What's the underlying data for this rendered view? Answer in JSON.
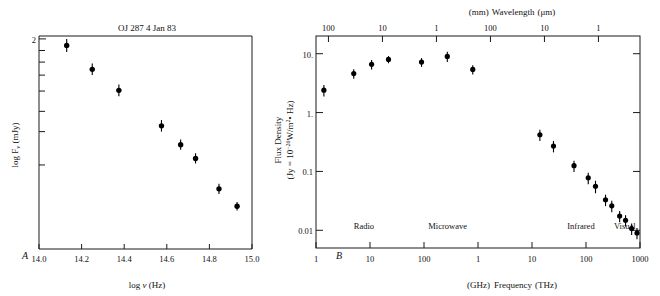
{
  "figure": {
    "background": "#ffffff",
    "ink": "#111111",
    "marker_color": "#000000"
  },
  "panel_a": {
    "label": "A",
    "title": "OJ 287    4 Jan 83",
    "xlabel_pre": "log ",
    "xlabel_sym": "ν",
    "xlabel_post": " (Hz)",
    "ylabel_pre": "log F",
    "ylabel_sub": "ν",
    "ylabel_post": " (mJy)",
    "x_ticks": [
      "14.0",
      "14.2",
      "14.4",
      "14.6",
      "14.8",
      "15.0"
    ],
    "y_ticks": [
      "2"
    ],
    "chart_data": {
      "type": "scatter",
      "title": "OJ 287    4 Jan 83",
      "xlabel": "log ν (Hz)",
      "ylabel": "log Fν (mJy)",
      "xlim": [
        14.0,
        15.0
      ],
      "ylim": [
        0.55,
        2.02
      ],
      "grid": false,
      "legend": "none",
      "xticks": [
        14.0,
        14.2,
        14.4,
        14.6,
        14.8,
        15.0
      ],
      "yticks_labeled": [
        2.0
      ],
      "yticks_minor": [
        1.92,
        1.84,
        1.75,
        1.64,
        1.5,
        1.36,
        1.13
      ],
      "x": [
        14.13,
        14.25,
        14.375,
        14.575,
        14.665,
        14.735,
        14.845,
        14.93
      ],
      "y": [
        1.955,
        1.79,
        1.645,
        1.4,
        1.27,
        1.175,
        0.965,
        0.845
      ],
      "yerr": [
        0.045,
        0.04,
        0.04,
        0.04,
        0.035,
        0.035,
        0.035,
        0.03
      ]
    }
  },
  "panel_b": {
    "label": "B",
    "top_axis_left_unit": "(mm)",
    "top_axis_name": "Wavelength",
    "top_axis_right_unit": "(μm)",
    "bottom_axis_left_unit": "(GHz)",
    "bottom_axis_name": "Frequency",
    "bottom_axis_right_unit": "(THz)",
    "ylabel_line1": "Flux Density",
    "ylabel_line2_a": "(Jy = 10",
    "ylabel_line2_exp": "−26",
    "ylabel_line2_b": "W/m",
    "ylabel_line2_exp2": "2",
    "ylabel_line2_c": "• Hz)",
    "y_ticks": [
      "10.",
      "1.",
      "0.1",
      "0.01"
    ],
    "top_ticks": [
      "100",
      "10",
      "1",
      "100",
      "10",
      "1"
    ],
    "bottom_ticks": [
      "1",
      "10",
      "100",
      "1",
      "10",
      "100",
      "1000"
    ],
    "bands": [
      "Radio",
      "Microwave",
      "Infrared",
      "Visual"
    ],
    "chart_data": {
      "type": "scatter",
      "title": "",
      "xlabel": "(GHz) Frequency (THz)",
      "ylabel": "Flux Density (Jy = 10−26 W/m2 • Hz)",
      "xlabel_top": "(mm) Wavelength (μm)",
      "x_is_log": true,
      "y_is_log": true,
      "xlim_ghz": [
        1,
        1000000
      ],
      "ylim": [
        0.005,
        20
      ],
      "grid": false,
      "legend": "none",
      "x_tick_values_ghz": [
        1,
        10,
        100,
        1000,
        10000,
        100000,
        1000000
      ],
      "x_tick_labels": [
        "1",
        "10",
        "100",
        "1",
        "10",
        "100",
        "1000"
      ],
      "y_tick_values": [
        10,
        1,
        0.1,
        0.01
      ],
      "y_tick_labels": [
        "10.",
        "1.",
        "0.1",
        "0.01"
      ],
      "top_tick_values_ghz": [
        1.7,
        17,
        170,
        1700,
        17000,
        170000
      ],
      "top_tick_labels": [
        "100",
        "10",
        "1",
        "100",
        "10",
        "1"
      ],
      "band_labels": [
        {
          "name": "Radio",
          "x_ghz": 5
        },
        {
          "name": "Microwave",
          "x_ghz": 120
        },
        {
          "name": "Infrared",
          "x_ghz": 45000
        },
        {
          "name": "Visual",
          "x_ghz": 330000
        }
      ],
      "points": [
        {
          "x_ghz": 1.4,
          "y": 2.4,
          "yerr_frac": 0.22
        },
        {
          "x_ghz": 5.0,
          "y": 4.6,
          "yerr_frac": 0.18
        },
        {
          "x_ghz": 10.7,
          "y": 6.6,
          "yerr_frac": 0.18
        },
        {
          "x_ghz": 22.0,
          "y": 8.0,
          "yerr_frac": 0.14
        },
        {
          "x_ghz": 90.0,
          "y": 7.2,
          "yerr_frac": 0.17
        },
        {
          "x_ghz": 270.0,
          "y": 9.0,
          "yerr_frac": 0.2
        },
        {
          "x_ghz": 800.0,
          "y": 5.4,
          "yerr_frac": 0.18
        },
        {
          "x_ghz": 14000,
          "y": 0.42,
          "yerr_frac": 0.22
        },
        {
          "x_ghz": 25000,
          "y": 0.27,
          "yerr_frac": 0.22
        },
        {
          "x_ghz": 60000,
          "y": 0.125,
          "yerr_frac": 0.22
        },
        {
          "x_ghz": 110000,
          "y": 0.078,
          "yerr_frac": 0.22
        },
        {
          "x_ghz": 150000,
          "y": 0.056,
          "yerr_frac": 0.24
        },
        {
          "x_ghz": 230000,
          "y": 0.033,
          "yerr_frac": 0.22
        },
        {
          "x_ghz": 300000,
          "y": 0.026,
          "yerr_frac": 0.22
        },
        {
          "x_ghz": 420000,
          "y": 0.0175,
          "yerr_frac": 0.22
        },
        {
          "x_ghz": 540000,
          "y": 0.0148,
          "yerr_frac": 0.22
        },
        {
          "x_ghz": 700000,
          "y": 0.0107,
          "yerr_frac": 0.22
        },
        {
          "x_ghz": 880000,
          "y": 0.009,
          "yerr_frac": 0.22
        }
      ]
    }
  }
}
